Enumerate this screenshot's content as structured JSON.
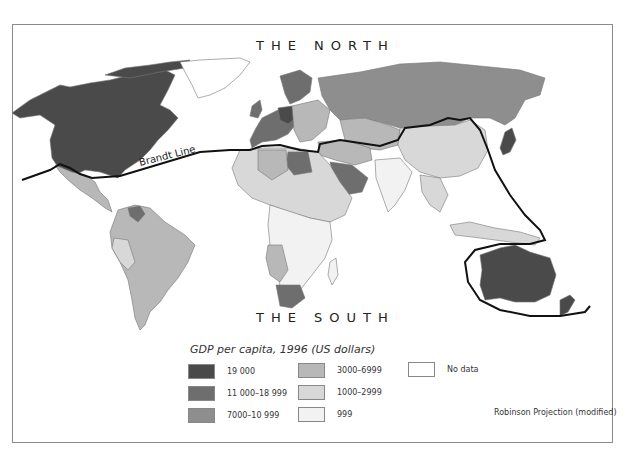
{
  "map": {
    "title_north": "THE NORTH",
    "title_south": "THE SOUTH",
    "line_label": "Brandt Line",
    "projection_note": "Robinson Projection (modified)"
  },
  "legend": {
    "title": "GDP per capita, 1996 (US dollars)",
    "items": [
      {
        "label": "19 000",
        "color": "#4a4a4a"
      },
      {
        "label": "11 000–18 999",
        "color": "#6e6e6e"
      },
      {
        "label": "7000–10 999",
        "color": "#8e8e8e"
      },
      {
        "label": "3000–6999",
        "color": "#b8b8b8"
      },
      {
        "label": "1000–2999",
        "color": "#d8d8d8"
      },
      {
        "label": "999",
        "color": "#f2f2f2"
      },
      {
        "label": "No data",
        "color": "#ffffff"
      }
    ]
  },
  "colors": {
    "border": "#8a8a8a",
    "brandt_line": "#111111",
    "country_outline": "#7a7a7a"
  }
}
